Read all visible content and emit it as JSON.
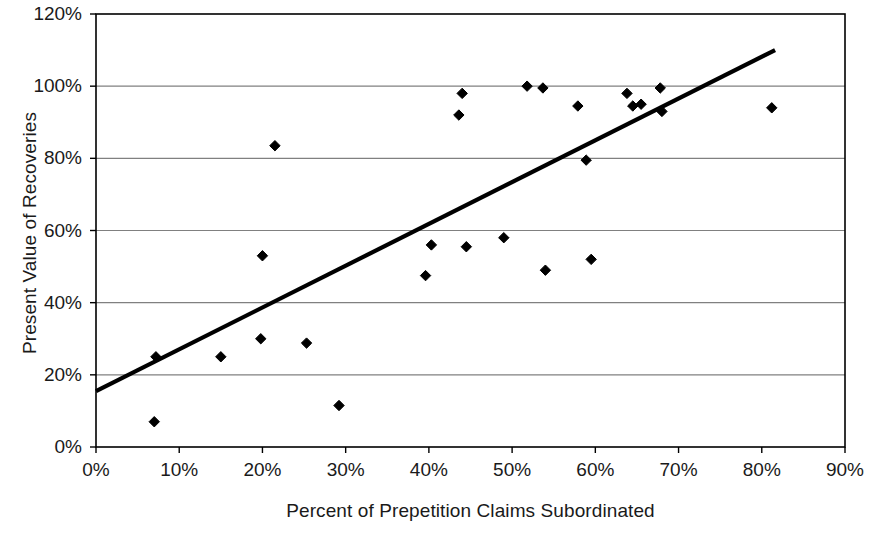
{
  "chart_data": {
    "type": "scatter",
    "title": "",
    "xlabel": "Percent of Prepetition Claims Subordinated",
    "ylabel": "Present Value of Recoveries",
    "xlim": [
      0,
      90
    ],
    "ylim": [
      0,
      120
    ],
    "xticks": [
      "0%",
      "10%",
      "20%",
      "30%",
      "40%",
      "50%",
      "60%",
      "70%",
      "80%",
      "90%"
    ],
    "xtick_values": [
      0,
      10,
      20,
      30,
      40,
      50,
      60,
      70,
      80,
      90
    ],
    "yticks": [
      "0%",
      "20%",
      "40%",
      "60%",
      "80%",
      "100%",
      "120%"
    ],
    "ytick_values": [
      0,
      20,
      40,
      60,
      80,
      100,
      120
    ],
    "grid": "horizontal",
    "legend": "none",
    "marker": "diamond",
    "marker_color": "#000000",
    "line_color": "#000000",
    "axis_color": "#000000",
    "grid_color": "#808080",
    "background": "#ffffff",
    "points": [
      {
        "x": 7.0,
        "y": 7.0
      },
      {
        "x": 7.2,
        "y": 25.0
      },
      {
        "x": 15.0,
        "y": 25.0
      },
      {
        "x": 19.8,
        "y": 30.0
      },
      {
        "x": 20.0,
        "y": 53.0
      },
      {
        "x": 21.5,
        "y": 83.5
      },
      {
        "x": 25.3,
        "y": 28.8
      },
      {
        "x": 29.2,
        "y": 11.5
      },
      {
        "x": 39.6,
        "y": 47.5
      },
      {
        "x": 40.3,
        "y": 56.0
      },
      {
        "x": 43.6,
        "y": 92.0
      },
      {
        "x": 44.0,
        "y": 98.0
      },
      {
        "x": 44.5,
        "y": 55.5
      },
      {
        "x": 49.0,
        "y": 58.0
      },
      {
        "x": 51.8,
        "y": 100.0
      },
      {
        "x": 53.7,
        "y": 99.5
      },
      {
        "x": 54.0,
        "y": 49.0
      },
      {
        "x": 57.9,
        "y": 94.5
      },
      {
        "x": 58.9,
        "y": 79.5
      },
      {
        "x": 59.5,
        "y": 52.0
      },
      {
        "x": 63.8,
        "y": 98.0
      },
      {
        "x": 64.5,
        "y": 94.5
      },
      {
        "x": 65.5,
        "y": 95.0
      },
      {
        "x": 67.8,
        "y": 99.5
      },
      {
        "x": 68.0,
        "y": 93.0
      },
      {
        "x": 81.2,
        "y": 94.0
      }
    ],
    "trendline": {
      "type": "linear",
      "x0": 0.0,
      "y0": 15.5,
      "x1": 81.6,
      "y1": 110.0
    }
  }
}
